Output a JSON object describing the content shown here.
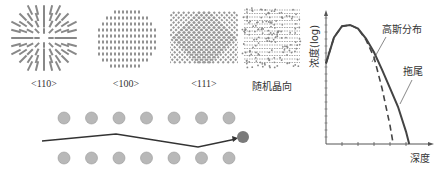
{
  "crystal_orientations": [
    {
      "id": "110",
      "label": "<110>",
      "pattern": "radial-dashes"
    },
    {
      "id": "100",
      "label": "<100>",
      "pattern": "horizontal-rows-circle"
    },
    {
      "id": "111",
      "label": "<111>",
      "pattern": "diagonal-cross"
    },
    {
      "id": "random",
      "label": "随机晶向",
      "pattern": "random-dense"
    }
  ],
  "channeling": {
    "top_row_atoms": 7,
    "bottom_row_atoms": 7,
    "atom_color": "#b8b8b8",
    "implanted_ion_color": "#7a7a7a",
    "path_color": "#333333"
  },
  "profile_chart": {
    "ylabel": "浓度(log)",
    "xlabel": "深度",
    "annotations": [
      "高斯分布",
      "拖尾"
    ],
    "curve_color": "#444444"
  },
  "chart_data": {
    "type": "line",
    "title": "",
    "xlabel": "深度",
    "ylabel": "浓度(log)",
    "xlim": [
      0,
      6
    ],
    "ylim": [
      0,
      10
    ],
    "grid": false,
    "series": [
      {
        "name": "高斯分布",
        "style": "dashed",
        "x": [
          0,
          0.5,
          1.0,
          1.5,
          2.0,
          2.5,
          3.0,
          3.5,
          4.0,
          4.2
        ],
        "y": [
          6.5,
          8.6,
          9.5,
          9.6,
          9.3,
          8.4,
          7.0,
          4.5,
          1.5,
          0
        ]
      },
      {
        "name": "拖尾",
        "style": "solid",
        "x": [
          0,
          0.5,
          1.0,
          1.5,
          2.0,
          2.5,
          3.0,
          3.5,
          4.0,
          4.5,
          5.0,
          5.2
        ],
        "y": [
          6.5,
          8.6,
          9.5,
          9.6,
          9.3,
          8.5,
          7.4,
          6.0,
          4.5,
          3.0,
          1.0,
          0
        ]
      }
    ]
  }
}
